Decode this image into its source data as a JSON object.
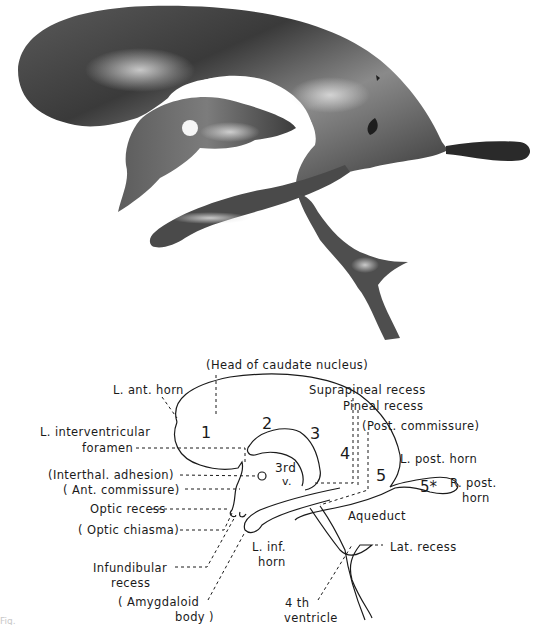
{
  "figure": {
    "photo": {
      "description": "Photograph of a cast of the cerebral ventricular system, lateral view",
      "tone": "grayscale",
      "colors": {
        "cast_dark": "#2e2e2e",
        "cast_mid": "#6a6a6a",
        "cast_light": "#bdbdbd",
        "background": "#ffffff"
      }
    },
    "diagram": {
      "line_color": "#1a1a1a",
      "labels": {
        "head_caudate": "(Head of caudate nucleus)",
        "l_ant_horn": "L. ant. horn",
        "l_interventricular_1": "L. interventricular",
        "l_interventricular_2": "foramen",
        "interthal_adhesion": "(Interthal. adhesion)",
        "ant_commissure": "( Ant. commissure)",
        "optic_recess": "Optic recess",
        "optic_chiasma": "( Optic chiasma)",
        "infundibular_1": "Infundibular",
        "infundibular_2": "recess",
        "amygdaloid_1": "( Amygdaloid",
        "amygdaloid_2": "body )",
        "suprapineal": "Suprapineal recess",
        "pineal": "Pineal recess",
        "post_commissure": "(Post. commissure)",
        "l_post_horn": "L. post. horn",
        "r_post_horn_1": "R. post.",
        "r_post_horn_2": "horn",
        "aqueduct": "Aqueduct",
        "lat_recess": "Lat. recess",
        "l_inf_horn_1": "L. inf.",
        "l_inf_horn_2": "horn",
        "fourth_ventricle_1": "4 th",
        "fourth_ventricle_2": "ventricle",
        "third_v_1": "3rd",
        "third_v_2": "v."
      },
      "region_numbers": [
        "1",
        "2",
        "3",
        "4",
        "5",
        "5*"
      ]
    },
    "caption": "Fig."
  }
}
